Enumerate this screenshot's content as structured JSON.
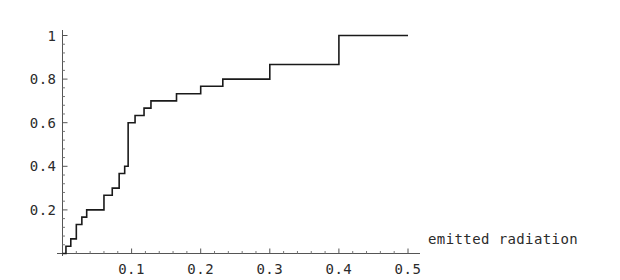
{
  "chart_data": {
    "type": "line",
    "subtype": "step-post",
    "title": "",
    "subtitle": "",
    "xlabel": "emitted radiation",
    "ylabel": "",
    "xlim": [
      0.0,
      0.5
    ],
    "ylim": [
      0.0,
      1.0
    ],
    "grid": false,
    "legend": null,
    "xticks": [
      0.1,
      0.2,
      0.3,
      0.4,
      0.5
    ],
    "xtick_labels": [
      "0.1",
      "0.2",
      "0.3",
      "0.4",
      "0.5"
    ],
    "yticks": [
      0.2,
      0.4,
      0.6,
      0.8,
      1.0
    ],
    "ytick_labels": [
      "0.2",
      "0.4",
      "0.6",
      "0.8",
      "1"
    ],
    "x_minor_tick_step": 0.02,
    "y_minor_tick_step": 0.04,
    "line_color": "#1a1a1a",
    "line_width": 1.6,
    "axis_color": "#555555",
    "x": [
      0.0,
      0.005,
      0.012,
      0.02,
      0.028,
      0.035,
      0.045,
      0.06,
      0.072,
      0.082,
      0.09,
      0.095,
      0.105,
      0.118,
      0.128,
      0.142,
      0.165,
      0.2,
      0.232,
      0.3,
      0.4,
      0.5
    ],
    "y": [
      0.0,
      0.033,
      0.067,
      0.133,
      0.167,
      0.2,
      0.2,
      0.267,
      0.3,
      0.367,
      0.4,
      0.6,
      0.633,
      0.667,
      0.7,
      0.7,
      0.733,
      0.767,
      0.8,
      0.867,
      1.0,
      1.0
    ],
    "steps": [
      {
        "x": 0.0,
        "y": 0.0
      },
      {
        "x": 0.005,
        "y": 0.033
      },
      {
        "x": 0.012,
        "y": 0.067
      },
      {
        "x": 0.02,
        "y": 0.133
      },
      {
        "x": 0.028,
        "y": 0.167
      },
      {
        "x": 0.035,
        "y": 0.2
      },
      {
        "x": 0.06,
        "y": 0.267
      },
      {
        "x": 0.072,
        "y": 0.3
      },
      {
        "x": 0.082,
        "y": 0.367
      },
      {
        "x": 0.09,
        "y": 0.4
      },
      {
        "x": 0.095,
        "y": 0.6
      },
      {
        "x": 0.105,
        "y": 0.633
      },
      {
        "x": 0.118,
        "y": 0.667
      },
      {
        "x": 0.128,
        "y": 0.7
      },
      {
        "x": 0.165,
        "y": 0.733
      },
      {
        "x": 0.2,
        "y": 0.767
      },
      {
        "x": 0.232,
        "y": 0.8
      },
      {
        "x": 0.3,
        "y": 0.867
      },
      {
        "x": 0.4,
        "y": 1.0
      },
      {
        "x": 0.5,
        "y": 1.0
      }
    ]
  },
  "axes": {
    "x_title": "emitted radiation",
    "x_tick_labels": [
      "0.1",
      "0.2",
      "0.3",
      "0.4",
      "0.5"
    ],
    "y_tick_labels": [
      "0.2",
      "0.4",
      "0.6",
      "0.8",
      "1"
    ]
  }
}
